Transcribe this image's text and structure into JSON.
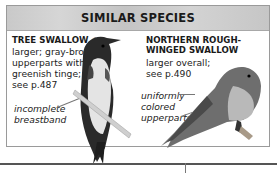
{
  "header": {
    "title": "SIMILAR SPECIES"
  },
  "species": [
    {
      "name": "TREE SWALLOW",
      "icon": "range-map-icon",
      "icon_glyph": "◔",
      "description": [
        "larger; gray-brown",
        "upperparts with",
        "greenish tinge;",
        "see p.487"
      ],
      "callout": [
        "incomplete",
        "breastband"
      ]
    },
    {
      "name_lines": [
        "NORTHERN ROUGH-",
        "WINGED SWALLOW"
      ],
      "description": [
        "larger overall;",
        "see p.490"
      ],
      "callout": [
        "uniformly",
        "colored",
        "upperparts"
      ]
    }
  ],
  "colors": {
    "header_bg": "#cccccc",
    "border": "#9a9a9a",
    "text": "#1a1a1a"
  }
}
